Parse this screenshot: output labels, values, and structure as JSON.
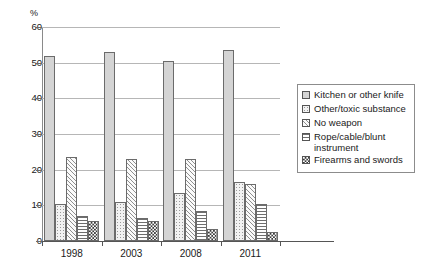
{
  "chart_data": {
    "type": "bar",
    "title": "",
    "subtitle": "",
    "xlabel": "",
    "ylabel": "%",
    "unit_label": "%",
    "categories": [
      "1998",
      "2003",
      "2008",
      "2011"
    ],
    "ylim": [
      0,
      60
    ],
    "yticks": [
      0,
      10,
      20,
      30,
      40,
      50,
      60
    ],
    "ytick_labels": [
      "0",
      "10",
      "20",
      "30",
      "40",
      "50",
      "60"
    ],
    "grid": true,
    "grid_axis": "y",
    "legend_position": "right",
    "series": [
      {
        "name": "Kitchen or other knife",
        "pattern": "solid-gray",
        "values": [
          52.0,
          53.0,
          50.5,
          53.5
        ]
      },
      {
        "name": "Other/toxic substance",
        "pattern": "light-dotted",
        "values": [
          10.5,
          11.0,
          13.5,
          16.5
        ]
      },
      {
        "name": "No weapon",
        "pattern": "diagonal-hatch",
        "values": [
          23.5,
          23.0,
          23.0,
          16.0
        ]
      },
      {
        "name": "Rope/cable/blunt instrument",
        "pattern": "horizontal-lines",
        "values": [
          7.0,
          6.5,
          8.5,
          10.5
        ]
      },
      {
        "name": "Firearms and swords",
        "pattern": "checkerboard",
        "values": [
          5.5,
          5.5,
          3.5,
          2.5
        ]
      }
    ],
    "colors": {
      "axis": "#555555",
      "gridline": "#b6b6b6",
      "bar_outline": "#6b6b6b",
      "series_1_fill": "#d4d4d4",
      "series_2_fill": "#f2f2f2",
      "series_3_fill": "#fafafa",
      "series_4_fill": "#ffffff",
      "series_5_fill": "#3a3a3a",
      "background": "#ffffff"
    }
  },
  "legend": {
    "items": [
      {
        "label": "Kitchen or other knife"
      },
      {
        "label": "Other/toxic substance"
      },
      {
        "label": "No weapon"
      },
      {
        "label": "Rope/cable/blunt\ninstrument"
      },
      {
        "label": "Firearms and swords"
      }
    ]
  }
}
